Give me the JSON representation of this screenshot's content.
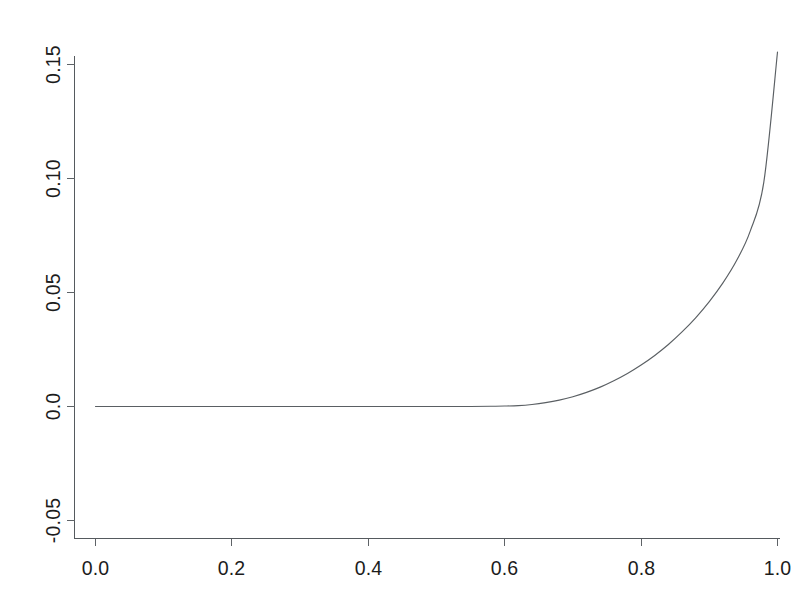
{
  "chart_data": {
    "type": "line",
    "title": "",
    "subtitle": "",
    "xlabel": "",
    "ylabel": "",
    "xlim": [
      -0.0325,
      1.0325
    ],
    "ylim": [
      -0.0635,
      0.1695
    ],
    "grid": false,
    "legend": null,
    "background_color": "#ffffff",
    "line_color": "#5a5f63",
    "axis_color": "#555a5e",
    "text_color": "#1c1c1c",
    "xticks": [
      0.0,
      0.2,
      0.4,
      0.6,
      0.8,
      1.0
    ],
    "xticklabels": [
      "0.0",
      "0.2",
      "0.4",
      "0.6",
      "0.8",
      "1.0"
    ],
    "yticks": [
      -0.05,
      0.0,
      0.05,
      0.1,
      0.15
    ],
    "yticklabels": [
      "-0.05",
      "0.0",
      "0.05",
      "0.10",
      "0.15"
    ],
    "ytick_label_rotation": 90,
    "series": [
      {
        "name": "curve",
        "x": [
          0.0,
          0.05,
          0.1,
          0.15,
          0.2,
          0.25,
          0.3,
          0.35,
          0.4,
          0.45,
          0.5,
          0.55,
          0.58,
          0.6,
          0.62,
          0.64,
          0.66,
          0.68,
          0.7,
          0.72,
          0.74,
          0.76,
          0.78,
          0.8,
          0.82,
          0.84,
          0.86,
          0.88,
          0.9,
          0.92,
          0.94,
          0.96,
          0.98,
          1.0
        ],
        "y": [
          0.0,
          0.0,
          0.0,
          0.0,
          0.0,
          0.0,
          0.0,
          0.0,
          0.0,
          0.0,
          0.0,
          0.0,
          0.0001,
          0.0002,
          0.0004,
          0.0009,
          0.0017,
          0.0028,
          0.0043,
          0.0062,
          0.0085,
          0.0113,
          0.0145,
          0.0182,
          0.0224,
          0.0272,
          0.0327,
          0.0389,
          0.046,
          0.0542,
          0.064,
          0.0769,
          0.0985,
          0.1555
        ]
      }
    ]
  },
  "figure": {
    "name": "line-plot"
  }
}
